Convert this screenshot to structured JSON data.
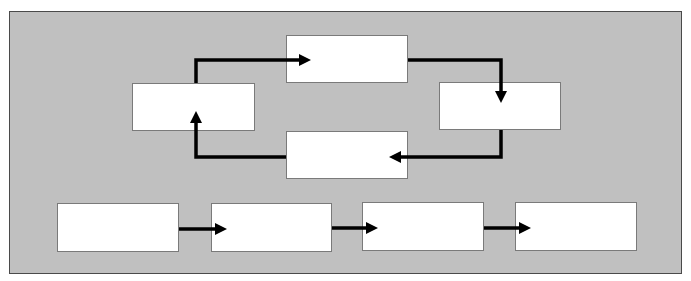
{
  "diagram": {
    "type": "flow-diagram",
    "background_color": "#c0c0c0",
    "node_color": "#ffffff",
    "arrow_color": "#000000",
    "cycle": {
      "nodes": [
        {
          "id": "cycle-top",
          "label": ""
        },
        {
          "id": "cycle-right",
          "label": ""
        },
        {
          "id": "cycle-bottom",
          "label": ""
        },
        {
          "id": "cycle-left",
          "label": ""
        }
      ],
      "edges": [
        {
          "from": "cycle-left",
          "to": "cycle-top"
        },
        {
          "from": "cycle-top",
          "to": "cycle-right"
        },
        {
          "from": "cycle-right",
          "to": "cycle-bottom"
        },
        {
          "from": "cycle-bottom",
          "to": "cycle-left"
        }
      ]
    },
    "sequence": {
      "nodes": [
        {
          "id": "step-1",
          "label": ""
        },
        {
          "id": "step-2",
          "label": ""
        },
        {
          "id": "step-3",
          "label": ""
        },
        {
          "id": "step-4",
          "label": ""
        }
      ],
      "edges": [
        {
          "from": "step-1",
          "to": "step-2"
        },
        {
          "from": "step-2",
          "to": "step-3"
        },
        {
          "from": "step-3",
          "to": "step-4"
        }
      ]
    }
  }
}
